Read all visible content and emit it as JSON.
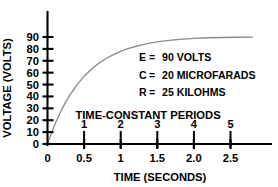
{
  "chart_data": {
    "type": "line",
    "title": "",
    "xlabel": "TIME (SECONDS)",
    "ylabel": "VOLTAGE (VOLTS)",
    "secondary_xlabel": "TIME-CONSTANT PERIODS",
    "xlim": [
      0,
      2.8
    ],
    "ylim": [
      0,
      95
    ],
    "grid": false,
    "legend": "none",
    "x_ticks": [
      0,
      0.5,
      1,
      1.5,
      2.0,
      2.5
    ],
    "x_tick_labels": [
      "0",
      "0.5",
      "1",
      "1.5",
      "2.0",
      "2.5"
    ],
    "y_ticks": [
      0,
      10,
      20,
      30,
      40,
      50,
      60,
      70,
      80,
      90
    ],
    "y_tick_labels": [
      "0",
      "10",
      "20",
      "30",
      "40",
      "50",
      "60",
      "70",
      "80",
      "90"
    ],
    "time_constant_ticks": [
      0.5,
      1.0,
      1.5,
      2.0,
      2.5
    ],
    "time_constant_labels": [
      "1",
      "2",
      "3",
      "4",
      "5"
    ],
    "series": [
      {
        "name": "Capacitor charging voltage",
        "color": "#8a8a8a",
        "x": [
          0,
          0.05,
          0.1,
          0.15,
          0.2,
          0.25,
          0.3,
          0.35,
          0.4,
          0.45,
          0.5,
          0.6,
          0.7,
          0.8,
          0.9,
          1.0,
          1.1,
          1.2,
          1.3,
          1.4,
          1.5,
          1.6,
          1.7,
          1.8,
          2.0,
          2.2,
          2.4,
          2.6,
          2.8
        ],
        "y": [
          0,
          8.6,
          16.4,
          23.4,
          29.7,
          35.4,
          40.6,
          45.2,
          49.5,
          53.3,
          56.9,
          62.9,
          67.9,
          71.9,
          75.2,
          78.0,
          80.2,
          82.0,
          83.6,
          84.8,
          85.9,
          86.7,
          87.4,
          88.0,
          88.9,
          89.4,
          89.6,
          89.8,
          89.9
        ]
      }
    ],
    "annotations": [
      {
        "key": "E",
        "eq": "=",
        "value": "90 VOLTS"
      },
      {
        "key": "C",
        "eq": "=",
        "value": "20 MICROFARADS"
      },
      {
        "key": "R",
        "eq": "=",
        "value": "25 KILOHMS"
      }
    ],
    "colors": {
      "axis": "#000000",
      "curve": "#8a8a8a",
      "background": "#ffffff"
    }
  }
}
